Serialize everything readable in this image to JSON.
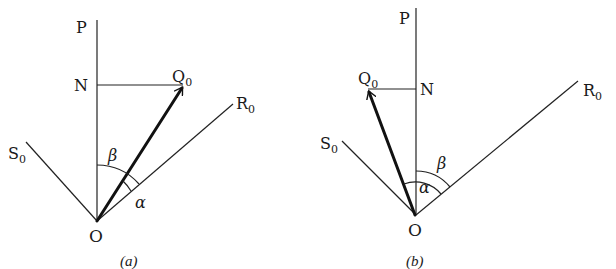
{
  "figure": {
    "panels": [
      {
        "id": "a",
        "caption": "(a)",
        "labels": {
          "P": "P",
          "N": "N",
          "Q": "Q",
          "Q_sub": "0",
          "R": "R",
          "R_sub": "0",
          "S": "S",
          "S_sub": "0",
          "O": "O",
          "beta": "β",
          "alpha": "α"
        },
        "description": "Vector OQ0 lies between vertical OP and line OR0; angle beta measured from OP to OR0, angle alpha between OQ0 and OR0; N is foot of perpendicular from Q0 to OP"
      },
      {
        "id": "b",
        "caption": "(b)",
        "labels": {
          "P": "P",
          "N": "N",
          "Q": "Q",
          "Q_sub": "0",
          "R": "R",
          "R_sub": "0",
          "S": "S",
          "S_sub": "0",
          "O": "O",
          "beta": "β",
          "alpha": "α"
        },
        "description": "Vector OQ0 lies between OS0 and vertical OP; angle beta from OP to OR0, angle alpha from OQ0 to OR0; N is foot of perpendicular from Q0 to OP"
      }
    ]
  }
}
